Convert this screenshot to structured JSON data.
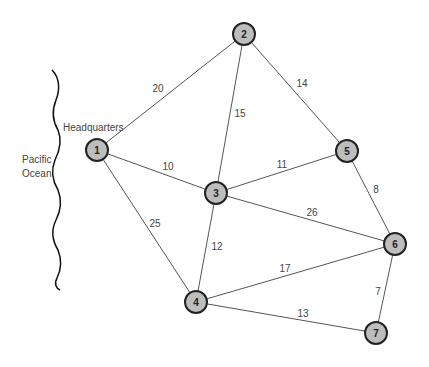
{
  "diagram": {
    "labels": {
      "ocean_line1": "Pacific",
      "ocean_line2": "Ocean",
      "headquarters": "Headquarters"
    },
    "nodes": [
      {
        "id": "1",
        "x": 97,
        "y": 150
      },
      {
        "id": "2",
        "x": 244,
        "y": 34
      },
      {
        "id": "3",
        "x": 216,
        "y": 193
      },
      {
        "id": "4",
        "x": 196,
        "y": 302
      },
      {
        "id": "5",
        "x": 347,
        "y": 151
      },
      {
        "id": "6",
        "x": 395,
        "y": 244
      },
      {
        "id": "7",
        "x": 376,
        "y": 333
      }
    ],
    "edges": [
      {
        "from": "1",
        "to": "2",
        "weight": "20",
        "lx": 158,
        "ly": 88
      },
      {
        "from": "1",
        "to": "3",
        "weight": "10",
        "lx": 168,
        "ly": 166
      },
      {
        "from": "1",
        "to": "4",
        "weight": "25",
        "lx": 155,
        "ly": 223
      },
      {
        "from": "2",
        "to": "3",
        "weight": "15",
        "lx": 240,
        "ly": 113
      },
      {
        "from": "2",
        "to": "5",
        "weight": "14",
        "lx": 302,
        "ly": 83
      },
      {
        "from": "3",
        "to": "5",
        "weight": "11",
        "lx": 282,
        "ly": 164
      },
      {
        "from": "3",
        "to": "4",
        "weight": "12",
        "lx": 217,
        "ly": 246
      },
      {
        "from": "3",
        "to": "6",
        "weight": "26",
        "lx": 312,
        "ly": 212
      },
      {
        "from": "5",
        "to": "6",
        "weight": "8",
        "lx": 376,
        "ly": 189
      },
      {
        "from": "4",
        "to": "6",
        "weight": "17",
        "lx": 285,
        "ly": 268
      },
      {
        "from": "4",
        "to": "7",
        "weight": "13",
        "lx": 303,
        "ly": 313
      },
      {
        "from": "6",
        "to": "7",
        "weight": "7",
        "lx": 378,
        "ly": 291
      }
    ]
  }
}
